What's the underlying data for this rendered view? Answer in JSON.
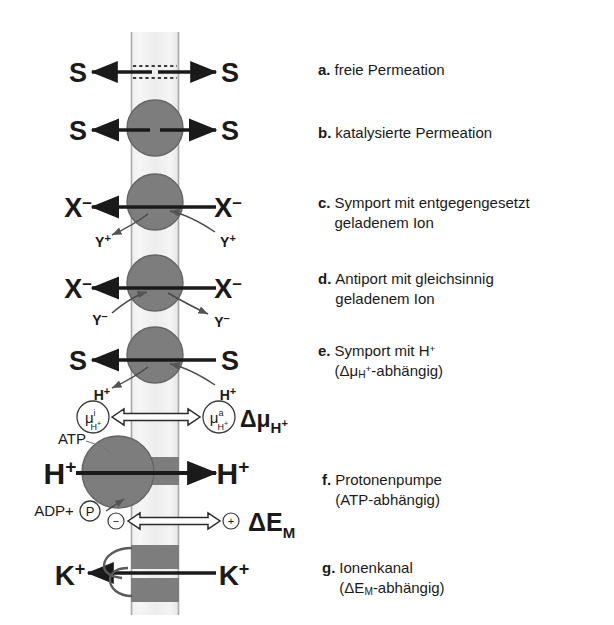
{
  "figure": {
    "kind": "membrane-transport-mechanisms-diagram",
    "language": "de",
    "colors": {
      "membrane_fill": "#e9e9e9",
      "membrane_edge": "#9a9a9a",
      "carrier_fill": "#7d7d7d",
      "carrier_edge": "#5f5f5f",
      "channel_band": "#7d7d7d",
      "arrow": "#1a1a1a",
      "text": "#1a1a1a",
      "background": "#ffffff"
    }
  },
  "legend": {
    "items": [
      {
        "key": "a.",
        "text": "freie Permeation"
      },
      {
        "key": "b.",
        "text": "katalysierte Permeation"
      },
      {
        "key": "c.",
        "text": "Symport mit entgegengesetzt\ngeladenem Ion"
      },
      {
        "key": "d.",
        "text": "Antiport mit gleichsinnig\ngeladenem Ion"
      },
      {
        "key": "e.",
        "text": "Symport mit H+\n(Δμ(H+)-abhängig)"
      },
      {
        "key": "f.",
        "text": "Protonenpumpe\n(ATP-abhängig)"
      },
      {
        "key": "g.",
        "text": "Ionenkanal\n(ΔE(M)-abhängig)"
      }
    ],
    "e_line1": "Symport mit H",
    "e_sup": "+",
    "e_line2_pre": "(Δμ",
    "e_line2_sub": "H",
    "e_line2_sub_sup": "+",
    "e_line2_post": "-abhängig)",
    "f_line1": "Protonenpumpe",
    "f_line2": "(ATP-abhängig)",
    "g_line1": "Ionenkanal",
    "g_line2_pre": "(ΔE",
    "g_line2_sub": "M",
    "g_line2_post": "-abhängig)"
  },
  "diagram": {
    "rows": {
      "a": {
        "left_label": "S",
        "right_label": "S",
        "mechanism": "free-permeation"
      },
      "b": {
        "left_label": "S",
        "right_label": "S",
        "mechanism": "catalysed-permeation"
      },
      "c": {
        "left_label": "X",
        "left_charge": "–",
        "right_label": "X",
        "right_charge": "–",
        "cosubstrate_left": "Y",
        "cosubstrate_left_charge": "+",
        "cosubstrate_right": "Y",
        "cosubstrate_right_charge": "+",
        "mechanism": "symport"
      },
      "d": {
        "left_label": "X",
        "left_charge": "–",
        "right_label": "X",
        "right_charge": "–",
        "cosubstrate_left": "Y",
        "cosubstrate_left_charge": "–",
        "cosubstrate_right": "Y",
        "cosubstrate_right_charge": "–",
        "mechanism": "antiport"
      },
      "e": {
        "left_label": "S",
        "right_label": "S",
        "cosubstrate_left": "H",
        "cosubstrate_left_charge": "+",
        "cosubstrate_right": "H",
        "cosubstrate_right_charge": "+",
        "mechanism": "proton-symport"
      },
      "gradient": {
        "left_symbol": "μ",
        "left_sup": "i",
        "left_sub": "H",
        "left_sub_sup": "+",
        "right_symbol": "μ",
        "right_sup": "a",
        "right_sub": "H",
        "right_sub_sup": "+",
        "delta_label": "Δμ",
        "delta_sub": "H",
        "delta_sub_sup": "+"
      },
      "f": {
        "left_label": "H",
        "left_charge": "+",
        "right_label": "H",
        "right_charge": "+",
        "substrate_in": "ATP",
        "substrate_out": "ADP+",
        "phosphate": "P",
        "mechanism": "proton-pump"
      },
      "potential": {
        "left_sign": "−",
        "right_sign": "+",
        "delta_label": "ΔE",
        "delta_sub": "M"
      },
      "g": {
        "left_label": "K",
        "left_charge": "+",
        "right_label": "K",
        "right_charge": "+",
        "mechanism": "ion-channel"
      }
    }
  }
}
